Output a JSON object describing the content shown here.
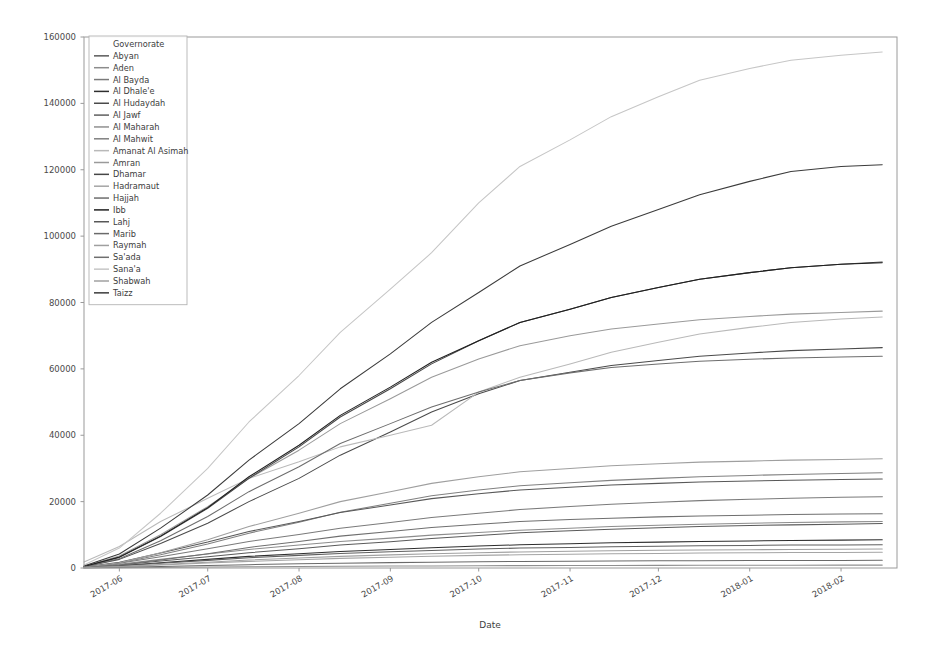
{
  "figure": {
    "background": "#ffffff",
    "width": 943,
    "height": 653
  },
  "axes": {
    "x_label": "Date",
    "y_label": "",
    "x_ticks": [
      "2017-06",
      "2017-07",
      "2017-08",
      "2017-09",
      "2017-10",
      "2017-11",
      "2017-12",
      "2018-01",
      "2018-02"
    ],
    "y_ticks": [
      "0",
      "20000",
      "40000",
      "60000",
      "80000",
      "100000",
      "120000",
      "140000",
      "160000"
    ],
    "grid": false
  },
  "legend": {
    "title": "Governorate",
    "position": "upper-left",
    "entries": [
      "Abyan",
      "Aden",
      "Al Bayda",
      "Al Dhale'e",
      "Al Hudaydah",
      "Al Jawf",
      "Al Maharah",
      "Al Mahwit",
      "Amanat Al Asimah",
      "Amran",
      "Dhamar",
      "Hadramaut",
      "Hajjah",
      "Ibb",
      "Lahj",
      "Marib",
      "Raymah",
      "Sa'ada",
      "Sana'a",
      "Shabwah",
      "Taizz"
    ]
  },
  "chart_data": {
    "type": "line",
    "title": "",
    "xlabel": "Date",
    "ylabel": "",
    "xlim": [
      "2017-05-20",
      "2018-02-20"
    ],
    "ylim": [
      0,
      160000
    ],
    "grid": false,
    "legend_position": "upper-left",
    "x": [
      "2017-05-20",
      "2017-06-01",
      "2017-06-15",
      "2017-07-01",
      "2017-07-15",
      "2017-08-01",
      "2017-08-15",
      "2017-09-01",
      "2017-09-15",
      "2017-10-01",
      "2017-10-15",
      "2017-11-01",
      "2017-11-15",
      "2017-12-01",
      "2017-12-15",
      "2018-01-01",
      "2018-01-15",
      "2018-02-01",
      "2018-02-15"
    ],
    "series": [
      {
        "name": "Abyan",
        "color": "#5a5a5a",
        "values": [
          200,
          900,
          2100,
          3400,
          4600,
          5800,
          6900,
          7900,
          8900,
          9800,
          10600,
          11200,
          11700,
          12100,
          12500,
          12800,
          13000,
          13200,
          13400
        ]
      },
      {
        "name": "Aden",
        "color": "#8c8c8c",
        "values": [
          300,
          1100,
          2600,
          4200,
          5600,
          6900,
          8000,
          9000,
          9900,
          10700,
          11400,
          12000,
          12500,
          12900,
          13200,
          13500,
          13700,
          13900,
          14000
        ]
      },
      {
        "name": "Al Bayda",
        "color": "#7a7a7a",
        "values": [
          250,
          1400,
          3400,
          5800,
          8000,
          10100,
          12000,
          13700,
          15200,
          16500,
          17600,
          18500,
          19200,
          19800,
          20300,
          20700,
          21000,
          21300,
          21500
        ]
      },
      {
        "name": "Al Dhale'e",
        "color": "#2e2e2e",
        "values": [
          180,
          700,
          1600,
          2600,
          3500,
          4300,
          5000,
          5600,
          6100,
          6600,
          7000,
          7300,
          7600,
          7800,
          8000,
          8150,
          8300,
          8400,
          8500
        ]
      },
      {
        "name": "Al Hudaydah",
        "color": "#4a4a4a",
        "values": [
          400,
          2600,
          7400,
          13500,
          20000,
          27000,
          34000,
          41000,
          47000,
          52500,
          56500,
          59000,
          61000,
          62500,
          63800,
          64800,
          65500,
          66000,
          66400
        ]
      },
      {
        "name": "Al Jawf",
        "color": "#5f5f5f",
        "values": [
          150,
          600,
          1400,
          2300,
          3100,
          3800,
          4400,
          4900,
          5300,
          5700,
          6000,
          6200,
          6400,
          6550,
          6700,
          6800,
          6900,
          6950,
          7000
        ]
      },
      {
        "name": "Al Maharah",
        "color": "#909090",
        "values": [
          30,
          90,
          180,
          280,
          370,
          450,
          520,
          580,
          630,
          680,
          720,
          750,
          780,
          800,
          820,
          840,
          855,
          865,
          875
        ]
      },
      {
        "name": "Al Mahwit",
        "color": "#808080",
        "values": [
          200,
          1500,
          4000,
          7200,
          10500,
          13800,
          16800,
          19500,
          21800,
          23500,
          24800,
          25700,
          26400,
          27000,
          27500,
          27900,
          28200,
          28500,
          28700
        ]
      },
      {
        "name": "Amanat Al Asimah",
        "color": "#b9b9b9",
        "values": [
          1800,
          6500,
          14000,
          21000,
          27000,
          32000,
          36500,
          40000,
          43000,
          53000,
          57500,
          61500,
          65000,
          68000,
          70500,
          72500,
          74000,
          75000,
          75600
        ]
      },
      {
        "name": "Amran",
        "color": "#9a9a9a",
        "values": [
          500,
          3600,
          10000,
          18500,
          27000,
          35500,
          43500,
          51000,
          57500,
          63000,
          67000,
          70000,
          72000,
          73500,
          74800,
          75800,
          76500,
          77000,
          77400
        ]
      },
      {
        "name": "Dhamar",
        "color": "#464646",
        "values": [
          400,
          3200,
          9500,
          18000,
          27000,
          36500,
          45500,
          54000,
          61500,
          68500,
          74000,
          78000,
          81500,
          84500,
          87000,
          89000,
          90500,
          91500,
          92200
        ]
      },
      {
        "name": "Hadramaut",
        "color": "#a5a5a5",
        "values": [
          120,
          400,
          900,
          1500,
          2000,
          2500,
          2900,
          3250,
          3550,
          3800,
          4000,
          4150,
          4300,
          4400,
          4500,
          4580,
          4650,
          4700,
          4750
        ]
      },
      {
        "name": "Hajjah",
        "color": "#6d6d6d",
        "values": [
          350,
          2800,
          8200,
          15500,
          23000,
          30500,
          37500,
          43500,
          48500,
          53000,
          56500,
          58800,
          60400,
          61500,
          62300,
          62900,
          63300,
          63600,
          63800
        ]
      },
      {
        "name": "Ibb",
        "color": "#1f1f1f",
        "values": [
          450,
          3300,
          9600,
          18200,
          27500,
          37000,
          46000,
          54500,
          62000,
          68500,
          74000,
          78000,
          81500,
          84500,
          87000,
          89000,
          90500,
          91500,
          92000
        ]
      },
      {
        "name": "Lahj",
        "color": "#585858",
        "values": [
          300,
          1700,
          4500,
          7800,
          11000,
          14000,
          16700,
          19000,
          20900,
          22400,
          23500,
          24300,
          25000,
          25500,
          25900,
          26200,
          26450,
          26650,
          26800
        ]
      },
      {
        "name": "Marib",
        "color": "#6a6a6a",
        "values": [
          60,
          200,
          450,
          750,
          1000,
          1250,
          1450,
          1620,
          1760,
          1880,
          1980,
          2060,
          2120,
          2170,
          2210,
          2240,
          2270,
          2290,
          2310
        ]
      },
      {
        "name": "Raymah",
        "color": "#9f9f9f",
        "values": [
          200,
          1600,
          4600,
          8500,
          12500,
          16500,
          20000,
          23000,
          25500,
          27500,
          29000,
          30000,
          30800,
          31400,
          31900,
          32200,
          32500,
          32700,
          32900
        ]
      },
      {
        "name": "Sa'ada",
        "color": "#6f6f6f",
        "values": [
          150,
          900,
          2400,
          4300,
          6200,
          8000,
          9600,
          11000,
          12200,
          13200,
          14000,
          14600,
          15000,
          15400,
          15700,
          15900,
          16100,
          16250,
          16350
        ]
      },
      {
        "name": "Sana'a",
        "color": "#c6c6c6",
        "values": [
          900,
          6000,
          16500,
          30000,
          44000,
          58000,
          71000,
          84000,
          95000,
          110000,
          121000,
          129000,
          136000,
          142000,
          147000,
          150500,
          153000,
          154500,
          155500
        ]
      },
      {
        "name": "Shabwah",
        "color": "#a0a0a0",
        "values": [
          100,
          450,
          1050,
          1750,
          2400,
          3000,
          3500,
          3950,
          4300,
          4600,
          4850,
          5050,
          5200,
          5330,
          5430,
          5520,
          5590,
          5650,
          5700
        ]
      },
      {
        "name": "Taizz",
        "color": "#3b3b3b",
        "values": [
          600,
          4200,
          12000,
          22000,
          32500,
          43500,
          54000,
          64500,
          74000,
          83000,
          91000,
          97500,
          103000,
          108000,
          112500,
          116500,
          119500,
          121000,
          121500
        ]
      }
    ]
  }
}
